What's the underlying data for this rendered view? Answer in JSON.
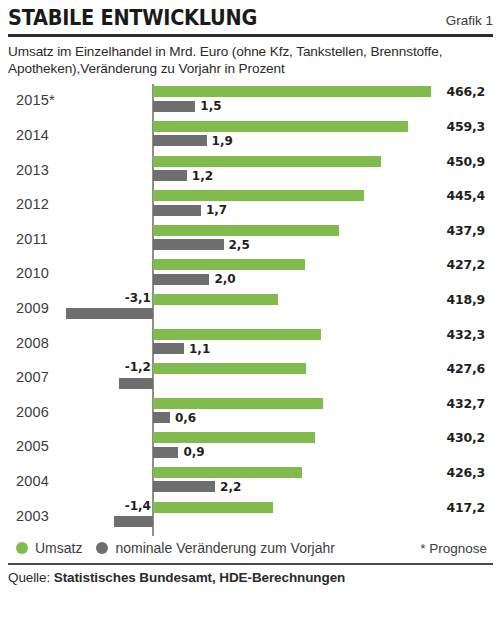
{
  "header": {
    "title": "STABILE ENTWICKLUNG",
    "figure_label": "Grafik 1"
  },
  "subtitle": "Umsatz im Einzelhandel in Mrd. Euro (ohne Kfz, Tankstellen, Brennstoffe, Apotheken),Veränderung zu Vorjahr in Prozent",
  "legend": {
    "umsatz": "Umsatz",
    "change": "nominale Veränderung zum Vorjahr",
    "note": "* Prognose"
  },
  "source": {
    "prefix": "Quelle:",
    "body": "Statistisches Bundesamt, HDE-Berechnungen"
  },
  "colors": {
    "umsatz": "#82bb4d",
    "change": "#6e6e6e",
    "axis": "#8e8e8e",
    "rule": "#2b2b2b"
  },
  "chart_data": {
    "type": "bar",
    "title": "STABILE ENTWICKLUNG",
    "subtitle": "Umsatz im Einzelhandel in Mrd. Euro (ohne Kfz, Tankstellen, Brennstoffe, Apotheken),Veränderung zu Vorjahr in Prozent",
    "orientation": "horizontal",
    "xlabel": "",
    "ylabel": "",
    "grid": false,
    "legend_position": "bottom",
    "categories": [
      "2015*",
      "2014",
      "2013",
      "2012",
      "2011",
      "2010",
      "2009",
      "2008",
      "2007",
      "2006",
      "2005",
      "2004",
      "2003"
    ],
    "series": [
      {
        "name": "Umsatz",
        "unit": "Mrd. Euro",
        "color": "#82bb4d",
        "values": [
          466.2,
          459.3,
          450.9,
          445.4,
          437.9,
          427.2,
          418.9,
          432.3,
          427.6,
          432.7,
          430.2,
          426.3,
          417.2
        ],
        "labels": [
          "466,2",
          "459,3",
          "450,9",
          "445,4",
          "437,9",
          "427,2",
          "418,9",
          "432,3",
          "427,6",
          "432,7",
          "430,2",
          "426,3",
          "417,2"
        ]
      },
      {
        "name": "nominale Veränderung zum Vorjahr",
        "unit": "Prozent",
        "color": "#6e6e6e",
        "values": [
          1.5,
          1.9,
          1.2,
          1.7,
          2.5,
          2.0,
          -3.1,
          1.1,
          -1.2,
          0.6,
          0.9,
          2.2,
          -1.4
        ],
        "labels": [
          "1,5",
          "1,9",
          "1,2",
          "1,7",
          "2,5",
          "2,0",
          "-3,1",
          "1,1",
          "-1,2",
          "0,6",
          "0,9",
          "2,2",
          "-1,4"
        ]
      }
    ]
  }
}
